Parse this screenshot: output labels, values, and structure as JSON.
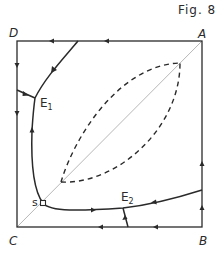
{
  "figure": {
    "title": "Fig. 8",
    "corners": {
      "top_left": "D",
      "top_right": "A",
      "bottom_left": "C",
      "bottom_right": "B"
    },
    "points": {
      "E1": {
        "main": "E",
        "sub": "1"
      },
      "E2": {
        "main": "E",
        "sub": "2"
      },
      "S": "s"
    },
    "colors": {
      "ink": "#2a2a2a",
      "diagonal": "#b8b8b8",
      "background": "#ffffff"
    }
  }
}
